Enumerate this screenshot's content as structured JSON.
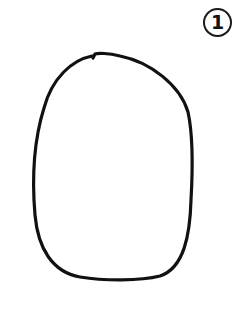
{
  "figure": {
    "step_number": "1",
    "shape": "hand-drawn-oval",
    "stroke_color": "#111111",
    "background_color": "#ffffff"
  }
}
